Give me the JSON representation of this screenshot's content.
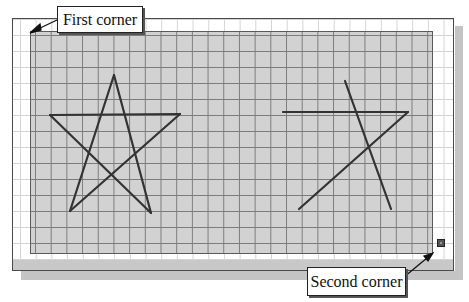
{
  "labels": {
    "first_corner": "First corner",
    "second_corner": "Second corner"
  },
  "colors": {
    "selection_fill": "#d2d2d2",
    "grid_line": "#7c7c7c",
    "outline": "#333333",
    "background": "#ffffff"
  },
  "drawing": {
    "full_star": {
      "vertices": [
        [
          114,
          75
        ],
        [
          50,
          115
        ],
        [
          180,
          114
        ],
        [
          70,
          211
        ],
        [
          151,
          213
        ]
      ]
    },
    "partial_star": {
      "segments": [
        [
          [
            345,
            81
          ],
          [
            391,
            209
          ]
        ],
        [
          [
            283,
            112
          ],
          [
            408,
            112
          ]
        ],
        [
          [
            408,
            112
          ],
          [
            299,
            209
          ]
        ]
      ]
    }
  },
  "selection_window": {
    "first_corner_point": [
      30,
      31
    ],
    "second_corner_point": [
      433,
      254
    ]
  }
}
